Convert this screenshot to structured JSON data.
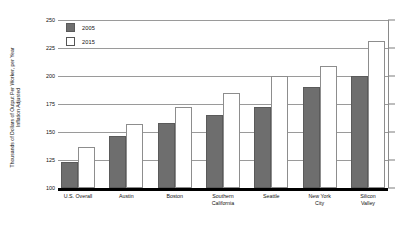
{
  "chart_data": {
    "type": "bar",
    "title": "",
    "subtitle": "",
    "xlabel": "",
    "ylabel": "Thousands of Dollars of Output Per Worker, per Year\nInflation Adjusted",
    "ylim": [
      100,
      250
    ],
    "yticks": [
      100,
      125,
      150,
      175,
      200,
      225,
      250
    ],
    "ytick_labels": [
      "100",
      "125",
      "150",
      "175",
      "200",
      "225",
      "250"
    ],
    "grid": true,
    "legend_position": "top-left",
    "categories": [
      "U.S. Overall",
      "Austin",
      "Boston",
      "Southern\nCalifornia",
      "Seattle",
      "New York\nCity",
      "Silicon\nValley"
    ],
    "series": [
      {
        "name": "2005",
        "color": "#6e6e6e",
        "values": [
          123,
          146,
          158,
          165,
          172,
          190,
          200
        ]
      },
      {
        "name": "2015",
        "color": "#ffffff",
        "values": [
          137,
          157,
          172,
          185,
          200,
          209,
          231
        ]
      }
    ]
  },
  "legend": {
    "items": [
      {
        "label": "2005"
      },
      {
        "label": "2015"
      }
    ]
  },
  "colors": {
    "series_2005": "#6e6e6e",
    "series_2015": "#ffffff",
    "gridline": "#9a9a9a",
    "baseline": "#000000",
    "text": "#111111",
    "background": "#ffffff"
  }
}
